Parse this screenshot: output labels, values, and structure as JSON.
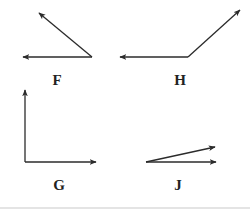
{
  "diagram": {
    "stroke_color": "#2b2b2b",
    "figures": [
      {
        "label": "F",
        "label_pos": [
          57,
          80
        ],
        "vertex": [
          92,
          57
        ],
        "vectors": [
          {
            "from": [
              92,
              57
            ],
            "to": [
              39,
              13
            ],
            "direction": "up-left"
          },
          {
            "from": [
              92,
              57
            ],
            "to": [
              23,
              57
            ],
            "direction": "left"
          }
        ]
      },
      {
        "label": "H",
        "label_pos": [
          180,
          80
        ],
        "vertex": [
          188,
          57
        ],
        "vectors": [
          {
            "from": [
              188,
              57
            ],
            "to": [
              120,
              57
            ],
            "direction": "left"
          },
          {
            "from": [
              188,
              57
            ],
            "to": [
              240,
              10
            ],
            "direction": "up-right"
          }
        ]
      },
      {
        "label": "G",
        "label_pos": [
          59,
          185
        ],
        "vertex": [
          25,
          162
        ],
        "vectors": [
          {
            "from": [
              25,
              162
            ],
            "to": [
              25,
              90
            ],
            "direction": "up"
          },
          {
            "from": [
              25,
              162
            ],
            "to": [
              96,
              162
            ],
            "direction": "right"
          }
        ]
      },
      {
        "label": "J",
        "label_pos": [
          178,
          185
        ],
        "vertex": [
          146,
          162
        ],
        "vectors": [
          {
            "from": [
              146,
              162
            ],
            "to": [
              215,
              147
            ],
            "direction": "up-right-shallow"
          },
          {
            "from": [
              146,
              162
            ],
            "to": [
              216,
              162
            ],
            "direction": "right"
          }
        ]
      }
    ]
  }
}
